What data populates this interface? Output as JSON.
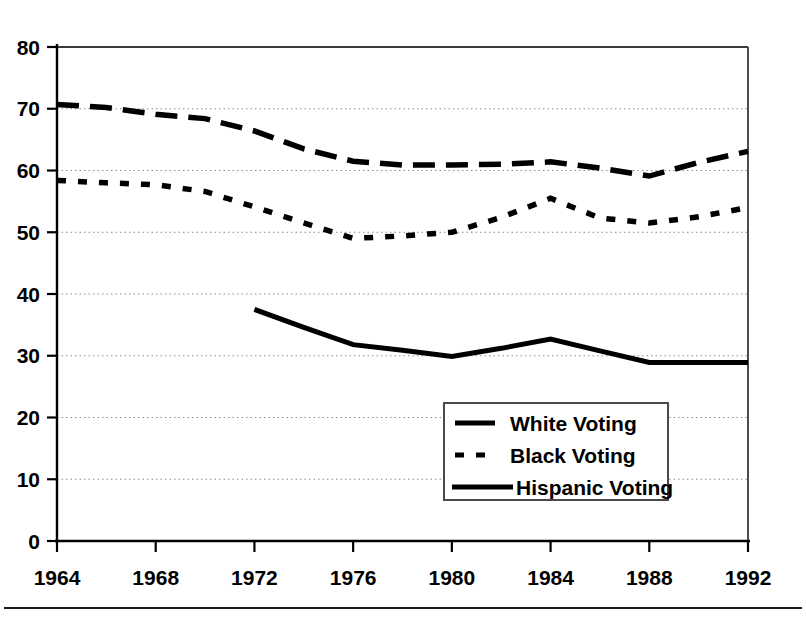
{
  "chart_data": {
    "type": "line",
    "title": "",
    "subtitle": "",
    "xlabel": "",
    "ylabel": "",
    "xlim": [
      1964,
      1992
    ],
    "ylim": [
      0,
      80
    ],
    "ytick_values": [
      0,
      10,
      20,
      30,
      40,
      50,
      60,
      70,
      80
    ],
    "ytick_labels": [
      "0",
      "10",
      "20",
      "30",
      "40",
      "50",
      "60",
      "70",
      "80"
    ],
    "xtick_values": [
      1964,
      1968,
      1972,
      1976,
      1980,
      1984,
      1988,
      1992
    ],
    "xtick_labels": [
      "1964",
      "1968",
      "1972",
      "1976",
      "1980",
      "1984",
      "1988",
      "1992"
    ],
    "grid": "horizontal-dotted",
    "gridline_values": [
      10,
      20,
      30,
      40,
      50,
      60,
      70
    ],
    "legend_position": "center-bottom-right",
    "series": [
      {
        "name": "White Voting",
        "style": "long-dash",
        "color": "#000000",
        "x": [
          1964,
          1966,
          1968,
          1970,
          1972,
          1974,
          1976,
          1978,
          1980,
          1982,
          1984,
          1986,
          1988,
          1990,
          1992
        ],
        "values": [
          70.7,
          70.2,
          69.1,
          68.4,
          66.4,
          63.5,
          61.5,
          60.9,
          60.9,
          61.0,
          61.4,
          60.4,
          59.1,
          61.3,
          63.1
        ]
      },
      {
        "name": "Black Voting",
        "style": "short-dash",
        "color": "#000000",
        "x": [
          1964,
          1966,
          1968,
          1970,
          1972,
          1974,
          1976,
          1978,
          1980,
          1982,
          1984,
          1986,
          1988,
          1990,
          1992
        ],
        "values": [
          58.4,
          58.0,
          57.7,
          56.6,
          54.1,
          51.5,
          49.0,
          49.4,
          50.0,
          52.4,
          55.5,
          52.3,
          51.5,
          52.5,
          54.0
        ]
      },
      {
        "name": "Hispanic Voting",
        "style": "solid",
        "color": "#000000",
        "x": [
          1972,
          1974,
          1976,
          1978,
          1980,
          1982,
          1984,
          1986,
          1988,
          1990,
          1992
        ],
        "values": [
          37.5,
          34.6,
          31.8,
          30.9,
          29.9,
          31.2,
          32.7,
          30.8,
          28.9,
          28.9,
          28.9
        ]
      }
    ]
  },
  "legend": {
    "items": [
      {
        "label": "White Voting",
        "marker": "long-dash-swatch"
      },
      {
        "label": "Black Voting",
        "marker": "short-dash-swatch"
      },
      {
        "label": "Hispanic Voting",
        "marker": "solid-swatch"
      }
    ]
  },
  "colors": {
    "ink": "#000000",
    "grid": "#8c8c8c",
    "frame": "#3a3a3a",
    "background": "#ffffff"
  }
}
